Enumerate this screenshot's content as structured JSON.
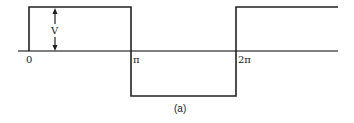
{
  "diagram": {
    "type": "square-wave",
    "caption": "(a)",
    "amplitude_label": "V",
    "x_labels": [
      {
        "text": "0",
        "x": 29
      },
      {
        "text": "π",
        "x": 131
      },
      {
        "text": "2π",
        "x": 236
      }
    ],
    "colors": {
      "stroke": "#222222",
      "background": "#ffffff"
    }
  }
}
